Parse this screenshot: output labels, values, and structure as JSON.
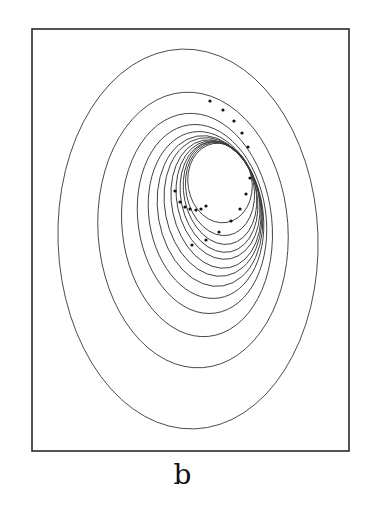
{
  "figure": {
    "panel_label": "b",
    "frame": {
      "x": 32,
      "y": 29,
      "width": 317,
      "height": 422
    },
    "colors": {
      "stroke": "#3a3a3a",
      "dot": "#111111",
      "background": "#ffffff"
    },
    "contours": [
      {
        "cx": 188,
        "cy": 239,
        "rx": 130,
        "ry": 190,
        "rot": -2
      },
      {
        "cx": 193,
        "cy": 230,
        "rx": 95,
        "ry": 138,
        "rot": -4
      },
      {
        "cx": 197,
        "cy": 225,
        "rx": 75,
        "ry": 112,
        "rot": -6
      },
      {
        "cx": 202,
        "cy": 219,
        "rx": 64,
        "ry": 95,
        "rot": -8
      },
      {
        "cx": 206,
        "cy": 215,
        "rx": 57,
        "ry": 84,
        "rot": -9
      },
      {
        "cx": 210,
        "cy": 211,
        "rx": 52,
        "ry": 76,
        "rot": -10
      },
      {
        "cx": 213,
        "cy": 207,
        "rx": 48,
        "ry": 70,
        "rot": -11
      },
      {
        "cx": 216,
        "cy": 204,
        "rx": 44,
        "ry": 65,
        "rot": -12
      },
      {
        "cx": 218,
        "cy": 200,
        "rx": 41,
        "ry": 60,
        "rot": -12
      },
      {
        "cx": 219,
        "cy": 197,
        "rx": 38,
        "ry": 56,
        "rot": -12
      },
      {
        "cx": 220,
        "cy": 193,
        "rx": 36,
        "ry": 52,
        "rot": -12
      },
      {
        "cx": 220,
        "cy": 189,
        "rx": 34,
        "ry": 47,
        "rot": -11
      },
      {
        "cx": 220,
        "cy": 183,
        "rx": 32,
        "ry": 40,
        "rot": -10
      }
    ],
    "points": [
      {
        "x": 210,
        "y": 101
      },
      {
        "x": 223,
        "y": 110
      },
      {
        "x": 234,
        "y": 121
      },
      {
        "x": 242,
        "y": 133
      },
      {
        "x": 248,
        "y": 147
      },
      {
        "x": 250,
        "y": 178
      },
      {
        "x": 246,
        "y": 194
      },
      {
        "x": 240,
        "y": 209
      },
      {
        "x": 231,
        "y": 221
      },
      {
        "x": 219,
        "y": 232
      },
      {
        "x": 206,
        "y": 240
      },
      {
        "x": 192,
        "y": 245
      },
      {
        "x": 175,
        "y": 191
      },
      {
        "x": 180,
        "y": 202
      },
      {
        "x": 185,
        "y": 207
      },
      {
        "x": 190,
        "y": 209
      },
      {
        "x": 196,
        "y": 210
      },
      {
        "x": 201,
        "y": 209
      },
      {
        "x": 206,
        "y": 206
      }
    ]
  }
}
